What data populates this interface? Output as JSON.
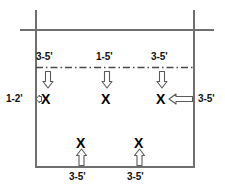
{
  "diagram": {
    "type": "spacing-layout",
    "frame": {
      "left_wall_label": "left-wall",
      "right_wall_label": "right-wall",
      "bottom_edge_label": "bottom-edge",
      "top_rail_label": "top-rail",
      "center_line_label": "center-dash-dot-line"
    },
    "colors": {
      "line": "#6f6f6f",
      "dark_line": "#555555",
      "text": "#111111",
      "arrow_fill": "#ffffff",
      "arrow_stroke": "#5a5a5a",
      "background": "#ffffff"
    },
    "top_labels": [
      {
        "id": "top-left-dim",
        "text": "3-5'"
      },
      {
        "id": "top-center-dim",
        "text": "1-5'"
      },
      {
        "id": "top-right-dim",
        "text": "3-5'"
      }
    ],
    "side_labels": [
      {
        "id": "left-dim",
        "text": "1-2'"
      },
      {
        "id": "right-dim",
        "text": "3-5'"
      }
    ],
    "bottom_labels": [
      {
        "id": "bottom-left-dim",
        "text": "3-5'"
      },
      {
        "id": "bottom-right-dim",
        "text": "3-5'"
      }
    ],
    "markers": {
      "glyph": "X",
      "middle_row": [
        {
          "id": "plant-marker-1",
          "text": "X"
        },
        {
          "id": "plant-marker-2",
          "text": "X"
        },
        {
          "id": "plant-marker-3",
          "text": "X"
        }
      ],
      "bottom_row": [
        {
          "id": "plant-marker-4",
          "text": "X"
        },
        {
          "id": "plant-marker-5",
          "text": "X"
        }
      ]
    },
    "arrows": {
      "down_count": 3,
      "up_count": 2,
      "left_large_count": 1,
      "left_small_count": 1
    }
  }
}
